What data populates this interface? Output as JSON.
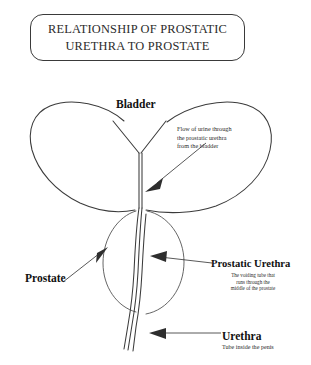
{
  "figure": {
    "title_lines": [
      "RELATIONSHIP OF PROSTATIC",
      "URETHRA TO PROSTATE"
    ],
    "background_color": "#ffffff",
    "ink_color": "#3b3b3b"
  },
  "labels": {
    "bladder": "Bladder",
    "prostate": "Prostate",
    "prostatic_urethra": "Prostatic Urethra",
    "urethra": "Urethra"
  },
  "captions": {
    "flow": {
      "line1": "Flow of urine through",
      "line2": "the prostatic urethra",
      "line3": "from the bladder"
    },
    "prostatic_urethra": {
      "line1": "The voiding tube that",
      "line2": "runs through the",
      "line3": "middle of the prostate"
    },
    "urethra": {
      "line1": "Tube inside the penis"
    }
  },
  "structures": [
    {
      "name": "ureters",
      "shape": "y-junction"
    },
    {
      "name": "bladder",
      "shape": "dome"
    },
    {
      "name": "prostate-left-lobe",
      "shape": "oval"
    },
    {
      "name": "prostate-right-lobe",
      "shape": "oval"
    },
    {
      "name": "prostatic-urethra",
      "shape": "channel"
    },
    {
      "name": "urethra",
      "shape": "tube"
    }
  ]
}
